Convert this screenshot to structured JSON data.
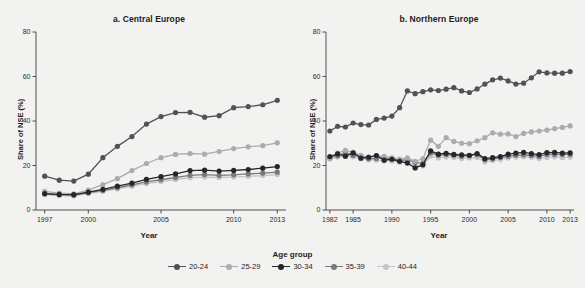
{
  "figure": {
    "cropped_caption_top": "",
    "background": "#f2f2f0",
    "axis_color": "#3c3c3c"
  },
  "legend": {
    "title": "Age group",
    "items": [
      {
        "label": "20-24",
        "color": "#4f5357"
      },
      {
        "label": "25-29",
        "color": "#a9adb0"
      },
      {
        "label": "30-34",
        "color": "#24262a"
      },
      {
        "label": "35-39",
        "color": "#76797d"
      },
      {
        "label": "40-44",
        "color": "#c2c5c7"
      }
    ]
  },
  "chart_data": [
    {
      "type": "line",
      "title": "a. Central Europe",
      "xlabel": "Year",
      "ylabel": "Share of NSE (%)",
      "xlim": [
        1996.4,
        2013.6
      ],
      "ylim": [
        0,
        80
      ],
      "yticks": [
        0,
        20,
        40,
        60,
        80
      ],
      "xticks": [
        1997,
        2000,
        2005,
        2010,
        2013
      ],
      "grid": false,
      "legend_position": "bottom",
      "x": [
        1997,
        1998,
        1999,
        2000,
        2001,
        2002,
        2003,
        2004,
        2005,
        2006,
        2007,
        2008,
        2009,
        2010,
        2011,
        2012,
        2013
      ],
      "series": [
        {
          "name": "20-24",
          "color": "#4f5357",
          "values": [
            15.2,
            13.4,
            13.0,
            16.1,
            23.5,
            28.6,
            33.0,
            38.6,
            42.0,
            43.8,
            43.9,
            41.7,
            42.4,
            46.0,
            46.5,
            47.3,
            49.3
          ]
        },
        {
          "name": "25-29",
          "color": "#a9adb0",
          "values": [
            8.4,
            7.6,
            7.3,
            8.9,
            11.4,
            14.1,
            17.7,
            20.9,
            23.5,
            25.0,
            25.4,
            25.1,
            26.3,
            27.6,
            28.4,
            28.9,
            30.2
          ]
        },
        {
          "name": "30-34",
          "color": "#24262a",
          "values": [
            7.4,
            7.0,
            6.9,
            8.0,
            9.3,
            10.7,
            12.1,
            13.8,
            15.0,
            16.2,
            17.7,
            17.9,
            17.5,
            17.8,
            18.2,
            18.8,
            19.5
          ]
        },
        {
          "name": "35-39",
          "color": "#76797d",
          "values": [
            7.2,
            6.8,
            6.7,
            7.8,
            8.8,
            10.0,
            11.3,
            12.6,
            13.6,
            14.6,
            15.6,
            15.9,
            15.6,
            15.8,
            16.2,
            16.6,
            17.0
          ]
        },
        {
          "name": "40-44",
          "color": "#c2c5c7",
          "values": [
            7.0,
            6.5,
            6.3,
            7.4,
            8.4,
            9.5,
            10.7,
            11.9,
            12.8,
            13.7,
            14.5,
            14.8,
            14.6,
            14.8,
            15.1,
            15.5,
            15.9
          ]
        }
      ]
    },
    {
      "type": "line",
      "title": "b. Northern Europe",
      "xlabel": "Year",
      "ylabel": "Share of NSE (%)",
      "xlim": [
        1981.5,
        2013.5
      ],
      "ylim": [
        0,
        80
      ],
      "yticks": [
        0,
        20,
        40,
        60,
        80
      ],
      "xticks": [
        1982,
        1985,
        1990,
        1995,
        2000,
        2005,
        2010,
        2013
      ],
      "grid": false,
      "legend_position": "bottom",
      "x": [
        1982,
        1983,
        1984,
        1985,
        1986,
        1987,
        1988,
        1989,
        1990,
        1991,
        1992,
        1993,
        1994,
        1995,
        1996,
        1997,
        1998,
        1999,
        2000,
        2001,
        2002,
        2003,
        2004,
        2005,
        2006,
        2007,
        2008,
        2009,
        2010,
        2011,
        2012,
        2013
      ],
      "series": [
        {
          "name": "20-24",
          "color": "#4f5357",
          "values": [
            35.5,
            37.6,
            37.3,
            39.1,
            38.4,
            38.2,
            40.7,
            41.3,
            42.2,
            46.0,
            53.5,
            52.3,
            53.2,
            54.0,
            53.7,
            54.3,
            55.0,
            53.5,
            52.8,
            54.4,
            56.6,
            58.5,
            59.3,
            58.0,
            56.6,
            57.0,
            59.4,
            62.1,
            61.6,
            61.5,
            61.5,
            62.2
          ]
        },
        {
          "name": "25-29",
          "color": "#a9adb0",
          "values": [
            23.2,
            25.6,
            26.8,
            25.9,
            24.6,
            23.8,
            24.5,
            24.1,
            23.5,
            22.9,
            23.4,
            21.9,
            23.0,
            31.4,
            28.6,
            32.5,
            30.8,
            30.0,
            29.8,
            31.1,
            32.5,
            34.7,
            34.1,
            34.2,
            33.0,
            34.4,
            35.1,
            35.5,
            35.9,
            36.6,
            37.1,
            37.8
          ]
        },
        {
          "name": "30-34",
          "color": "#24262a",
          "values": [
            24.0,
            25.2,
            24.2,
            25.7,
            23.3,
            23.7,
            24.5,
            22.4,
            22.8,
            21.9,
            21.1,
            18.9,
            20.3,
            26.6,
            25.1,
            25.5,
            25.0,
            24.8,
            24.6,
            25.4,
            23.1,
            23.5,
            24.0,
            25.1,
            25.6,
            25.9,
            25.3,
            24.9,
            25.8,
            25.9,
            25.6,
            25.7
          ]
        },
        {
          "name": "35-39",
          "color": "#76797d",
          "values": [
            23.6,
            24.4,
            25.6,
            24.5,
            24.3,
            23.0,
            23.2,
            23.4,
            23.1,
            22.4,
            22.5,
            21.4,
            21.0,
            25.7,
            24.6,
            24.9,
            24.6,
            24.2,
            24.4,
            24.8,
            22.6,
            23.0,
            23.6,
            24.2,
            24.6,
            24.8,
            24.5,
            24.1,
            24.9,
            25.0,
            24.9,
            25.0
          ]
        },
        {
          "name": "40-44",
          "color": "#c2c5c7",
          "values": [
            22.9,
            23.8,
            24.1,
            23.9,
            23.0,
            22.6,
            22.4,
            22.1,
            22.0,
            21.4,
            21.6,
            20.2,
            19.8,
            24.2,
            23.4,
            23.8,
            23.6,
            23.2,
            23.4,
            23.6,
            21.6,
            22.2,
            22.6,
            23.4,
            23.8,
            23.9,
            23.7,
            23.2,
            23.6,
            23.9,
            23.5,
            23.8
          ]
        }
      ]
    }
  ]
}
